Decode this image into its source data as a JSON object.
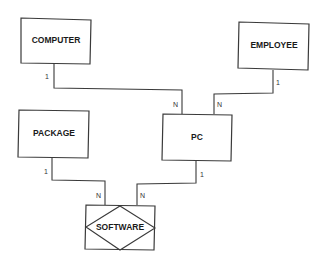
{
  "diagram": {
    "type": "er-diagram",
    "entities": [
      {
        "id": "computer",
        "label": "COMPUTER",
        "x": 21,
        "y": 18,
        "w": 70,
        "h": 46,
        "kind": "entity"
      },
      {
        "id": "employee",
        "label": "EMPLOYEE",
        "x": 239,
        "y": 22,
        "w": 70,
        "h": 48,
        "kind": "entity"
      },
      {
        "id": "package",
        "label": "PACKAGE",
        "x": 19,
        "y": 110,
        "w": 70,
        "h": 47,
        "kind": "entity"
      },
      {
        "id": "pc",
        "label": "PC",
        "x": 163,
        "y": 114,
        "w": 69,
        "h": 47,
        "kind": "entity"
      },
      {
        "id": "software",
        "label": "SOFTWARE",
        "x": 86,
        "y": 205,
        "w": 69,
        "h": 45,
        "kind": "associative-entity"
      }
    ],
    "relationships": [
      {
        "from": "computer",
        "to": "pc",
        "from_card": "1",
        "to_card": "N"
      },
      {
        "from": "employee",
        "to": "pc",
        "from_card": "1",
        "to_card": "N"
      },
      {
        "from": "package",
        "to": "software",
        "from_card": "1",
        "to_card": "N"
      },
      {
        "from": "pc",
        "to": "software",
        "from_card": "1",
        "to_card": "N"
      }
    ],
    "cardinality_labels": {
      "computer_pc_from": "1",
      "computer_pc_to": "N",
      "employee_pc_from": "1",
      "employee_pc_to": "N",
      "package_software_from": "1",
      "package_software_to": "N",
      "pc_software_from": "1",
      "pc_software_to": "N"
    },
    "colors": {
      "line": "#3a3a3a",
      "text": "#1a1a1a",
      "background": "#ffffff"
    }
  }
}
